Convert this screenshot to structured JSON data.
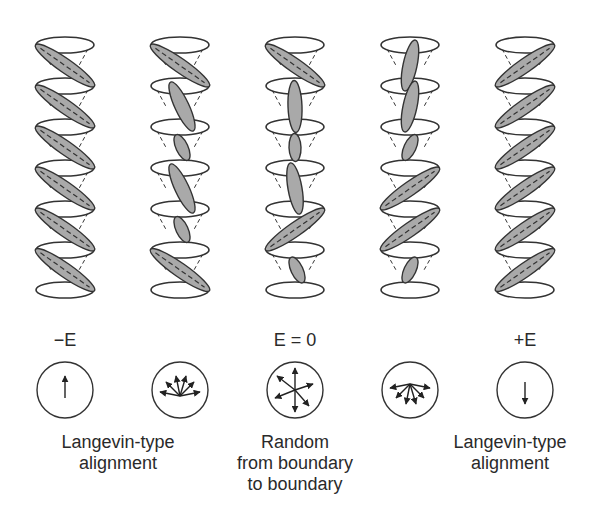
{
  "figure": {
    "columns": [
      {
        "id": "col-1",
        "cx": 65,
        "molecules": [
          "L",
          "L",
          "L",
          "L",
          "L",
          "L"
        ]
      },
      {
        "id": "col-2",
        "cx": 180,
        "molecules": [
          "L",
          "T",
          "t",
          "T",
          "t",
          "L"
        ]
      },
      {
        "id": "col-3",
        "cx": 295,
        "molecules": [
          "L",
          "V",
          "v",
          "V2",
          "R",
          "t"
        ]
      },
      {
        "id": "col-4",
        "cx": 410,
        "molecules": [
          "U",
          "U",
          "u",
          "R",
          "R",
          "u"
        ]
      },
      {
        "id": "col-5",
        "cx": 525,
        "molecules": [
          "R",
          "R",
          "R",
          "R",
          "R",
          "R"
        ]
      }
    ],
    "field_labels": [
      {
        "text": "−E",
        "x": 65
      },
      {
        "text": "E = 0",
        "x": 295
      },
      {
        "text": "+E",
        "x": 525
      }
    ],
    "circles": [
      {
        "id": "circle-1",
        "cx": 65,
        "kind": "up"
      },
      {
        "id": "circle-2",
        "cx": 180,
        "kind": "fan-up"
      },
      {
        "id": "circle-3",
        "cx": 295,
        "kind": "random"
      },
      {
        "id": "circle-4",
        "cx": 410,
        "kind": "fan-down"
      },
      {
        "id": "circle-5",
        "cx": 525,
        "kind": "down"
      }
    ],
    "captions": [
      {
        "lines": [
          "Langevin-type",
          "alignment"
        ],
        "x": 118
      },
      {
        "lines": [
          "Random",
          "from boundary",
          "to boundary"
        ],
        "x": 295
      },
      {
        "lines": [
          "Langevin-type",
          "alignment"
        ],
        "x": 510
      }
    ],
    "colors": {
      "molecule_fill": "#a9a9a9",
      "stroke": "#333333",
      "background": "#ffffff"
    }
  }
}
